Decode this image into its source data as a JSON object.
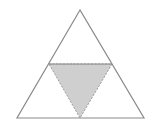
{
  "diagram": {
    "type": "triangle-midpoint-subdivision",
    "outer_triangle": {
      "points": [
        [
          80,
          10
        ],
        [
          17,
          118
        ],
        [
          144,
          118
        ]
      ],
      "stroke": "#8a8a8a",
      "fill": "#ffffff"
    },
    "midline": {
      "from": [
        49,
        64
      ],
      "to": [
        112,
        64
      ],
      "stroke": "#8a8a8a"
    },
    "shaded_triangle": {
      "points": [
        [
          49,
          64
        ],
        [
          112,
          64
        ],
        [
          80,
          118
        ]
      ],
      "fill": "#cfcfcf",
      "stroke": "#9a9a9a",
      "dashed": true
    }
  }
}
